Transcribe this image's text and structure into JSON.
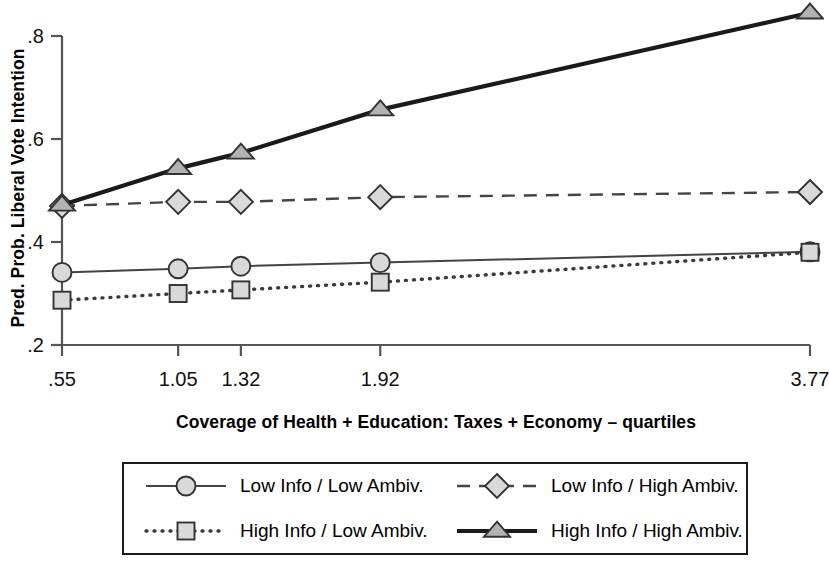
{
  "chart_data": {
    "type": "line",
    "title": "",
    "xlabel": "Coverage of Health + Education: Taxes + Economy – quartiles",
    "ylabel": "Pred. Prob. Liberal Vote Intention",
    "x": [
      0.55,
      1.05,
      1.32,
      1.92,
      3.77
    ],
    "xtick_labels": [
      ".55",
      "1.05",
      "1.32",
      "1.92",
      "3.77"
    ],
    "ytick_labels": [
      ".2",
      ".4",
      ".6",
      ".8"
    ],
    "ytick_values": [
      0.2,
      0.4,
      0.6,
      0.8
    ],
    "xlim": [
      0.55,
      3.77
    ],
    "ylim": [
      0.2,
      0.8
    ],
    "grid": false,
    "legend_position": "below-axes",
    "series": [
      {
        "name": "Low Info / Low Ambiv.",
        "marker": "circle",
        "linestyle": "solid-thin",
        "values": [
          0.341,
          0.348,
          0.353,
          0.36,
          0.381
        ]
      },
      {
        "name": "Low Info / High Ambiv.",
        "marker": "diamond",
        "linestyle": "dashed",
        "values": [
          0.47,
          0.478,
          0.478,
          0.487,
          0.497
        ]
      },
      {
        "name": "High Info / Low Ambiv.",
        "marker": "square",
        "linestyle": "dotted",
        "values": [
          0.287,
          0.3,
          0.307,
          0.322,
          0.38
        ]
      },
      {
        "name": "High Info / High Ambiv.",
        "marker": "triangle",
        "linestyle": "solid-thick",
        "values": [
          0.472,
          0.543,
          0.573,
          0.657,
          0.845
        ]
      }
    ],
    "colors": {
      "marker_fill": "#d9d9d9",
      "marker_fill_dark": "#b3b3b3",
      "marker_stroke": "#333333",
      "line": "#444444",
      "line_bold": "#1a1a1a",
      "axis": "#555555",
      "text": "#000000"
    }
  },
  "legend": {
    "entries": [
      {
        "label": "Low Info / Low Ambiv.",
        "marker": "circle-icon",
        "linestyle": "solid-thin"
      },
      {
        "label": "Low Info / High Ambiv.",
        "marker": "diamond-icon",
        "linestyle": "dashed"
      },
      {
        "label": "High Info / Low Ambiv.",
        "marker": "square-icon",
        "linestyle": "dotted"
      },
      {
        "label": "High Info / High Ambiv.",
        "marker": "triangle-icon",
        "linestyle": "solid-thick"
      }
    ]
  }
}
